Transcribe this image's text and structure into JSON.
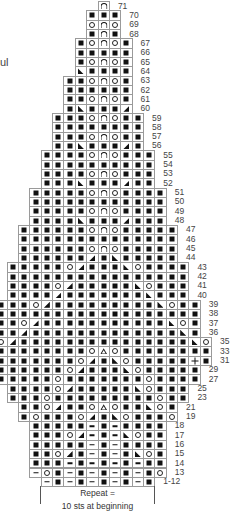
{
  "page": {
    "left_fragment_text": "ul"
  },
  "legend_symbols": {
    "K": "filled-square",
    "O": "open-circle",
    "A": "arch",
    "L": "left-triangle",
    "R": "right-triangle",
    "T": "delta-triangle",
    "P": "plus",
    "D": "dash"
  },
  "chart": {
    "cell_width": 11.36,
    "row_height": 9.33,
    "center_x": 103.2,
    "top_y": 1,
    "rows": [
      {
        "label": "71",
        "start": 0,
        "cells": "A"
      },
      {
        "label": "70",
        "start": -1,
        "cells": "KKK"
      },
      {
        "label": "69",
        "start": -1,
        "cells": "OAO"
      },
      {
        "label": "68",
        "start": -1,
        "cells": "KAK"
      },
      {
        "label": "67",
        "start": -2,
        "cells": "KOAOK"
      },
      {
        "label": "66",
        "start": -2,
        "cells": "KKKKK"
      },
      {
        "label": "65",
        "start": -2,
        "cells": "KOAOK"
      },
      {
        "label": "64",
        "start": -2,
        "cells": "LKKKK"
      },
      {
        "label": "63",
        "start": -3,
        "cells": "KKOAOK"
      },
      {
        "label": "62",
        "start": -3,
        "cells": "KKKKKK"
      },
      {
        "label": "61",
        "start": -3,
        "cells": "KKOAOK"
      },
      {
        "label": "60",
        "start": -3,
        "cells": "KLKKKR"
      },
      {
        "label": "59",
        "start": -4,
        "cells": "KKKOAOKK"
      },
      {
        "label": "58",
        "start": -4,
        "cells": "KKKKKKKK"
      },
      {
        "label": "57",
        "start": -4,
        "cells": "KKKOAOKK"
      },
      {
        "label": "56",
        "start": -4,
        "cells": "KKLKKKRK"
      },
      {
        "label": "55",
        "start": -5,
        "cells": "KKKKOAOKKK"
      },
      {
        "label": "54",
        "start": -5,
        "cells": "KKKKKKKKKK"
      },
      {
        "label": "53",
        "start": -5,
        "cells": "KKKKOAOKKK"
      },
      {
        "label": "52",
        "start": -5,
        "cells": "KKKLKKKRKK"
      },
      {
        "label": "51",
        "start": -6,
        "cells": "KKKKKOAOKKKK"
      },
      {
        "label": "50",
        "start": -6,
        "cells": "KKKKKKKKKKKK"
      },
      {
        "label": "49",
        "start": -6,
        "cells": "KKKKKOAOKKKK"
      },
      {
        "label": "48",
        "start": -6,
        "cells": "KKKKLKKKRKKK"
      },
      {
        "label": "47",
        "start": -7,
        "cells": "KKKKKKOAOKKKKK"
      },
      {
        "label": "46",
        "start": -7,
        "cells": "KKKKKKKKKKKKKK"
      },
      {
        "label": "45",
        "start": -7,
        "cells": "KKKKKKOAOKKKKK"
      },
      {
        "label": "44",
        "start": -7,
        "cells": "KKKKKKRKLKKKKK"
      },
      {
        "label": "43",
        "start": -8,
        "cells": "KKKKKORKKKLOKKKK"
      },
      {
        "label": "42",
        "start": -8,
        "cells": "KKKKKKKKKKKKKKKK"
      },
      {
        "label": "41",
        "start": -8,
        "cells": "KKKKORKKKKKLOKKK"
      },
      {
        "label": "40",
        "start": -8,
        "cells": "KKKKRKKKKKKKLKKK"
      },
      {
        "label": "39",
        "start": -9,
        "cells": "KKKORKKKKKKKKKLOKK"
      },
      {
        "label": "38",
        "start": -9,
        "cells": "KKKKKKKKKKKKKKKKKK"
      },
      {
        "label": "37",
        "start": -9,
        "cells": "KKORKKKKKKKKKKKLOK"
      },
      {
        "label": "36",
        "start": -9,
        "cells": "KKRKKKKKKKKKKKKKLK"
      },
      {
        "label": "35",
        "start": -9,
        "cells": "ORKKKKKKKKKKKKKKKLO"
      },
      {
        "label": "33",
        "start": -9,
        "cells": "KKKKKKKKOTOKKKKKKKK"
      },
      {
        "label": "31",
        "start": -9,
        "cells": "KKKKKKKORKLOKKKKKPK"
      },
      {
        "label": "29",
        "start": -9,
        "cells": "KKKKKKORKKKLOKKKKK"
      },
      {
        "label": "27",
        "start": -9,
        "cells": "KKKKKOKKKKKKKOKKKK"
      },
      {
        "label": "25",
        "start": -8,
        "cells": "KKKKORKKKKKLOKKK"
      },
      {
        "label": "23",
        "start": -8,
        "cells": "KKKOKKKKKKKKKOKK"
      },
      {
        "label": "21",
        "start": -7,
        "cells": "KKORKKOTOKKLOK"
      },
      {
        "label": "19",
        "start": -7,
        "cells": "KOKKKORKLOKKKO"
      },
      {
        "label": "18",
        "start": -6,
        "cells": "KKKKKDKDKKKK"
      },
      {
        "label": "17",
        "start": -6,
        "cells": "KKKORDKDLOKK"
      },
      {
        "label": "16",
        "start": -6,
        "cells": "KKKKKDKDKKKK"
      },
      {
        "label": "15",
        "start": -6,
        "cells": "KKORKDKDKLOK"
      },
      {
        "label": "14",
        "start": -6,
        "cells": "KKKDKDKDKDKK"
      },
      {
        "label": "13",
        "start": -6,
        "cells": "DOKDKDKDKDKO"
      },
      {
        "label": "1-12",
        "start": -5,
        "cells": "DKDKDKDKDK"
      }
    ]
  },
  "repeat": {
    "line1": "Repeat =",
    "line2": "10 sts at beginning"
  }
}
